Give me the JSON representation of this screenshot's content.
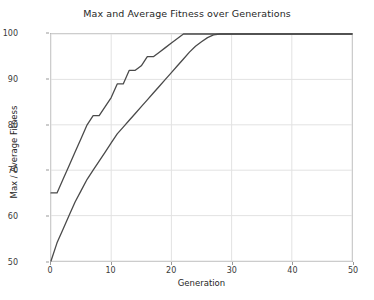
{
  "chart_data": {
    "type": "line",
    "title": "Max and Average Fitness over Generations",
    "xlabel": "Generation",
    "ylabel": "Max / Average Fitness",
    "xlim": [
      0,
      50
    ],
    "ylim": [
      50,
      100
    ],
    "xticks": [
      0,
      10,
      20,
      30,
      40,
      50
    ],
    "yticks": [
      50,
      60,
      70,
      80,
      90,
      100
    ],
    "grid": true,
    "legend": "none",
    "line_color": "#4a4a4a",
    "grid_color": "#e2e2e2",
    "background": "#ffffff",
    "x": [
      0,
      1,
      2,
      3,
      4,
      5,
      6,
      7,
      8,
      9,
      10,
      11,
      12,
      13,
      14,
      15,
      16,
      17,
      18,
      19,
      20,
      21,
      22,
      23,
      24,
      25,
      26,
      27,
      28,
      29,
      30,
      31,
      32,
      33,
      34,
      35,
      36,
      37,
      38,
      39,
      40,
      41,
      42,
      43,
      44,
      45,
      46,
      47,
      48,
      49,
      50
    ],
    "series": [
      {
        "name": "Max Fitness",
        "values": [
          65,
          65,
          68,
          71,
          74,
          77,
          80,
          82,
          82,
          84,
          86,
          89,
          89,
          92,
          92,
          93,
          95,
          95,
          96,
          97,
          98,
          99,
          100,
          100,
          100,
          100,
          100,
          100,
          100,
          100,
          100,
          100,
          100,
          100,
          100,
          100,
          100,
          100,
          100,
          100,
          100,
          100,
          100,
          100,
          100,
          100,
          100,
          100,
          100,
          100,
          100
        ]
      },
      {
        "name": "Average Fitness",
        "values": [
          50,
          54,
          57,
          60,
          63,
          65.5,
          68,
          70,
          72,
          74,
          76,
          78,
          79.5,
          81,
          82.5,
          84,
          85.5,
          87,
          88.5,
          90,
          91.5,
          93,
          94.5,
          96,
          97.3,
          98.3,
          99.2,
          99.8,
          100,
          100,
          100,
          100,
          100,
          100,
          100,
          100,
          100,
          100,
          100,
          100,
          100,
          100,
          100,
          100,
          100,
          100,
          100,
          100,
          100,
          100,
          100
        ]
      }
    ]
  }
}
